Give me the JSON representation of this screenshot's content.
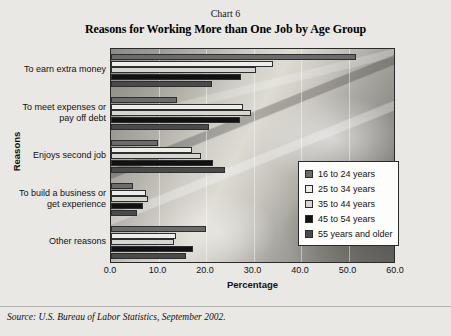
{
  "header": {
    "chart_number": "Chart 6",
    "title": "Reasons for Working More than One Job by Age Group"
  },
  "source_note": "Source: U.S. Bureau of Labor Statistics, September 2002.",
  "legend": {
    "items": [
      {
        "label": "16 to 24 years",
        "color": "#6b6b6b"
      },
      {
        "label": "25 to 34 years",
        "color": "#ededea"
      },
      {
        "label": "35 to 44 years",
        "color": "#d6d5d0"
      },
      {
        "label": "45 to 54 years",
        "color": "#111111"
      },
      {
        "label": "55 years and older",
        "color": "#4a4a4a"
      }
    ]
  },
  "axes": {
    "x_title": "Percentage",
    "y_title": "Reasons",
    "x_ticks": [
      "0.0",
      "10.0",
      "20.0",
      "30.0",
      "40.0",
      "50.0",
      "60.0"
    ]
  },
  "chart_data": {
    "type": "bar",
    "orientation": "horizontal",
    "title": "Reasons for Working More than One Job by Age Group",
    "subtitle": "Chart 6",
    "xlabel": "Percentage",
    "ylabel": "Reasons",
    "xlim": [
      0,
      60
    ],
    "xtick_step": 10,
    "grid": true,
    "legend_position": "center-right",
    "categories": [
      "To earn extra money",
      "To meet expenses or pay off debt",
      "Enjoys second job",
      "To build a business or get experience",
      "Other reasons"
    ],
    "series": [
      {
        "name": "16 to 24 years",
        "color": "#6b6b6b",
        "values": [
          51.5,
          13.9,
          9.8,
          4.6,
          20.0
        ]
      },
      {
        "name": "25 to 34 years",
        "color": "#ededea",
        "values": [
          34.1,
          27.8,
          17.1,
          7.4,
          13.6
        ]
      },
      {
        "name": "35 to 44 years",
        "color": "#d6d5d0",
        "values": [
          30.6,
          29.4,
          19.0,
          7.7,
          13.3
        ]
      },
      {
        "name": "45 to 54 years",
        "color": "#111111",
        "values": [
          27.4,
          27.1,
          21.4,
          6.8,
          17.3
        ]
      },
      {
        "name": "55 years and older",
        "color": "#4a4a4a",
        "values": [
          21.2,
          20.6,
          24.0,
          5.4,
          15.8
        ]
      }
    ]
  }
}
